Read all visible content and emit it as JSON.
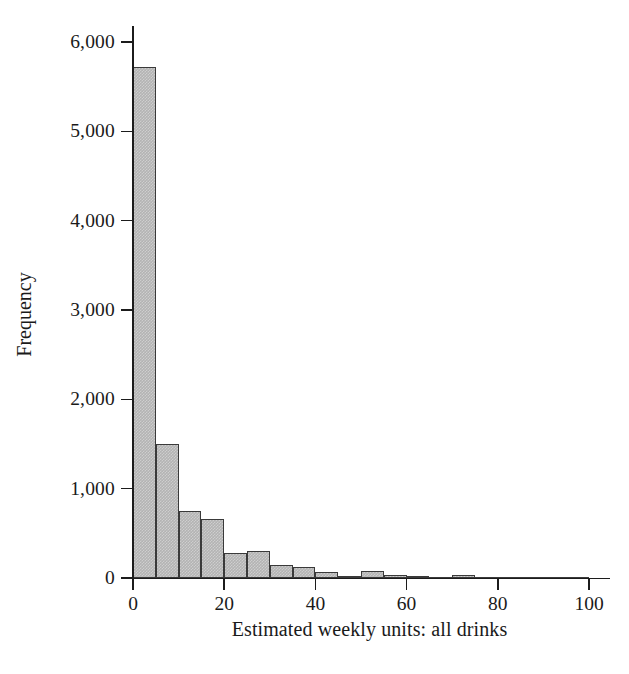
{
  "chart_data": {
    "type": "bar",
    "title": "",
    "subtitle": "",
    "xlabel": "Estimated weekly units: all drinks",
    "ylabel": "Frequency",
    "xlim": [
      0,
      103
    ],
    "ylim": [
      0,
      6200
    ],
    "grid": false,
    "legend": null,
    "bin_width": 5,
    "x_ticks": [
      0,
      20,
      40,
      60,
      80,
      100
    ],
    "x_tick_labels": [
      "0",
      "20",
      "40",
      "60",
      "80",
      "100"
    ],
    "y_ticks": [
      0,
      1000,
      2000,
      3000,
      4000,
      5000,
      6000
    ],
    "y_tick_labels": [
      "0",
      "1,000",
      "2,000",
      "3,000",
      "4,000",
      "5,000",
      "6,000"
    ],
    "bar_fill_color": "#b3b3b3",
    "bar_edge_color": "#3a3a3a",
    "axis_color": "#1c1c1c",
    "background_color": "#ffffff",
    "bins": [
      {
        "left": 0,
        "right": 5,
        "value": 5720
      },
      {
        "left": 5,
        "right": 10,
        "value": 1500
      },
      {
        "left": 10,
        "right": 15,
        "value": 750
      },
      {
        "left": 15,
        "right": 20,
        "value": 660
      },
      {
        "left": 20,
        "right": 25,
        "value": 275
      },
      {
        "left": 25,
        "right": 30,
        "value": 305
      },
      {
        "left": 30,
        "right": 35,
        "value": 145
      },
      {
        "left": 35,
        "right": 40,
        "value": 125
      },
      {
        "left": 40,
        "right": 45,
        "value": 65
      },
      {
        "left": 45,
        "right": 50,
        "value": 25
      },
      {
        "left": 50,
        "right": 55,
        "value": 75
      },
      {
        "left": 55,
        "right": 60,
        "value": 28
      },
      {
        "left": 60,
        "right": 65,
        "value": 22
      },
      {
        "left": 65,
        "right": 70,
        "value": 12
      },
      {
        "left": 70,
        "right": 75,
        "value": 30
      },
      {
        "left": 75,
        "right": 80,
        "value": 10
      },
      {
        "left": 80,
        "right": 85,
        "value": 8
      },
      {
        "left": 85,
        "right": 90,
        "value": 6
      },
      {
        "left": 90,
        "right": 95,
        "value": 12
      },
      {
        "left": 95,
        "right": 100,
        "value": 6
      }
    ],
    "categories": [
      "0-5",
      "5-10",
      "10-15",
      "15-20",
      "20-25",
      "25-30",
      "30-35",
      "35-40",
      "40-45",
      "45-50",
      "50-55",
      "55-60",
      "60-65",
      "65-70",
      "70-75",
      "75-80",
      "80-85",
      "85-90",
      "90-95",
      "95-100"
    ],
    "values": [
      5720,
      1500,
      750,
      660,
      275,
      305,
      145,
      125,
      65,
      25,
      75,
      28,
      22,
      12,
      30,
      10,
      8,
      6,
      12,
      6
    ]
  }
}
